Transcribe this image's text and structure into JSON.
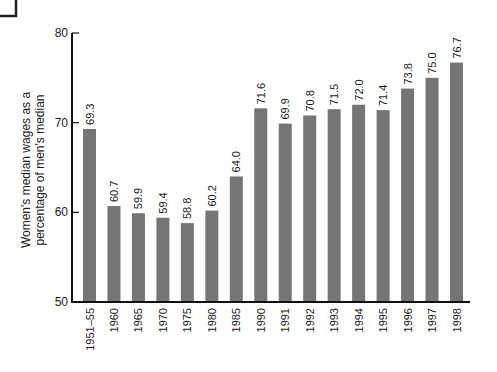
{
  "chart_data": {
    "type": "bar",
    "title": "",
    "xlabel": "",
    "ylabel": "Women's median wages as a percentage of men's median",
    "ylabel_lines": [
      "Women's median wages as a",
      "percentage of men's median"
    ],
    "ylim": [
      50,
      80
    ],
    "yticks": [
      50,
      60,
      70,
      80
    ],
    "grid": false,
    "legend": null,
    "categories": [
      "1951–55",
      "1960",
      "1965",
      "1970",
      "1975",
      "1980",
      "1985",
      "1990",
      "1991",
      "1992",
      "1993",
      "1994",
      "1995",
      "1996",
      "1997",
      "1998"
    ],
    "values": [
      69.3,
      60.7,
      59.9,
      59.4,
      58.8,
      60.2,
      64.0,
      71.6,
      69.9,
      70.8,
      71.5,
      72.0,
      71.4,
      73.8,
      75.0,
      76.7
    ],
    "value_labels": [
      "69.3",
      "60.7",
      "59.9",
      "59.4",
      "58.8",
      "60.2",
      "64.0",
      "71.6",
      "69.9",
      "70.8",
      "71.5",
      "72.0",
      "71.4",
      "73.8",
      "75.0",
      "76.7"
    ],
    "bar_color": "#757575"
  },
  "colors": {
    "bar": "#757575",
    "axis": "#111111",
    "background": "#ffffff"
  }
}
